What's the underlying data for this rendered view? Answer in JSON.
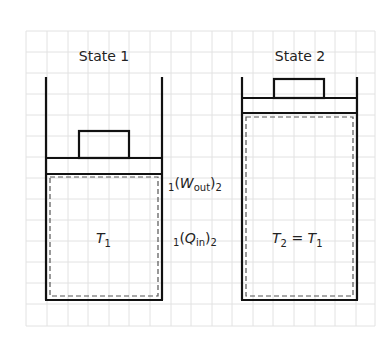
{
  "diagram": {
    "type": "piston-cylinder process",
    "states": [
      {
        "title": "State 1",
        "gas_label": "T",
        "gas_label_sub": "1",
        "gas_label_suffix": ""
      },
      {
        "title": "State 2",
        "gas_label": "T",
        "gas_label_sub": "2",
        "gas_label_suffix": " = T",
        "gas_label_suffix_sub": "1"
      }
    ],
    "transfers": [
      {
        "pre_sub": "1",
        "open": "(",
        "symbol": "W",
        "symbol_sub": "out",
        "close": ")",
        "post_sub": "2"
      },
      {
        "pre_sub": "1",
        "open": "(",
        "symbol": "Q",
        "symbol_sub": "in",
        "close": ")",
        "post_sub": "2"
      }
    ],
    "colors": {
      "line": "#111111",
      "dashed": "#555555",
      "grid": "#e2e2e2",
      "background": "#ffffff"
    }
  }
}
